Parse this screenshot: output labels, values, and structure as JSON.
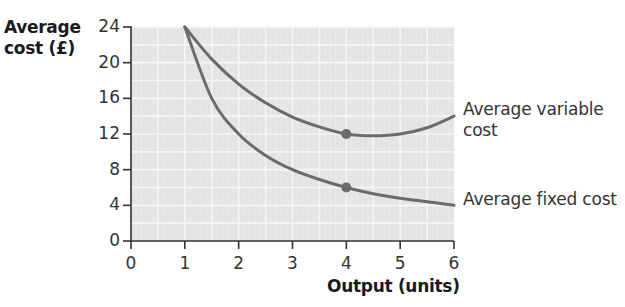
{
  "chart_data": {
    "type": "line",
    "title": "",
    "xlabel": "Output (units)",
    "ylabel": "Average cost (£)",
    "ylabel_lines": [
      "Average",
      "cost (£)"
    ],
    "xlim": [
      0,
      6
    ],
    "ylim": [
      0,
      24
    ],
    "x_ticks": [
      "0",
      "1",
      "2",
      "3",
      "4",
      "5",
      "6"
    ],
    "y_ticks": [
      "0",
      "4",
      "8",
      "12",
      "16",
      "20",
      "24"
    ],
    "grid": true,
    "series": [
      {
        "name": "Average variable cost",
        "label_lines": [
          "Average variable",
          "cost"
        ],
        "x": [
          1,
          1.5,
          2,
          2.5,
          3,
          3.5,
          4,
          4.5,
          5,
          5.5,
          6
        ],
        "y": [
          24,
          20.4,
          17.6,
          15.5,
          13.9,
          12.8,
          12,
          11.8,
          12,
          12.7,
          14
        ],
        "marker": {
          "x": 4,
          "y": 12
        }
      },
      {
        "name": "Average fixed cost",
        "label_lines": [
          "Average fixed cost"
        ],
        "x": [
          1,
          1.5,
          2,
          2.5,
          3,
          3.5,
          4,
          4.5,
          5,
          5.5,
          6
        ],
        "y": [
          24,
          16,
          12,
          9.6,
          8,
          6.9,
          6,
          5.3,
          4.8,
          4.4,
          4
        ],
        "marker": {
          "x": 4,
          "y": 6
        }
      }
    ],
    "colors": {
      "curve": "#6b6b6b",
      "grid_bg": "#e4e4e4",
      "grid_line": "#f6f6f6",
      "axis": "#333333"
    }
  }
}
